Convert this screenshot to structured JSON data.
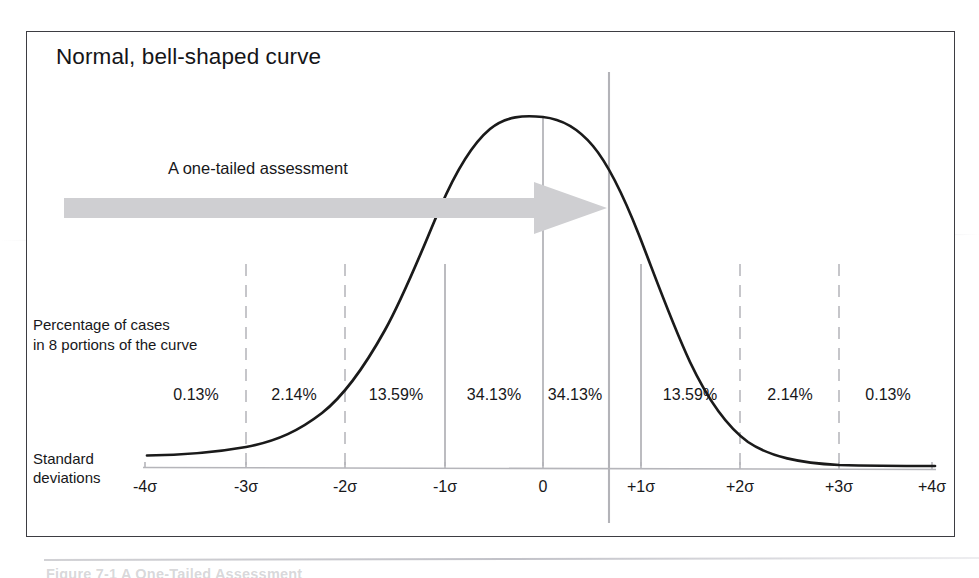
{
  "figure": {
    "title": "Normal, bell-shaped curve",
    "arrow_label": "A one-tailed assessment",
    "percentage_caption_line1": "Percentage of cases",
    "percentage_caption_line2": "in 8 portions of the curve",
    "sd_caption_line1": "Standard",
    "sd_caption_line2": "deviations",
    "caption_ghost": "Figure 7-1   A One-Tailed Assessment"
  },
  "colors": {
    "frame_border": "#3d3d42",
    "curve": "#1a1a1a",
    "gridline_solid": "#b9b9bd",
    "gridline_dashed": "#c6c6ca",
    "cutoff_line": "#b3b3b8",
    "axis_line": "#b5b5ba",
    "arrow_fill": "#cfcfd2",
    "text": "#17171a"
  },
  "chart_data": {
    "type": "line",
    "title": "Normal, bell-shaped curve",
    "xlabel": "Standard deviations",
    "ylabel": "",
    "xlim": [
      -4,
      4
    ],
    "ylim": [
      0,
      1
    ],
    "grid": true,
    "legend": null,
    "distribution": "standard normal (gaussian)",
    "categories": [
      "-4σ",
      "-3σ",
      "-2σ",
      "-1σ",
      "0",
      "+1σ",
      "+2σ",
      "+3σ",
      "+4σ"
    ],
    "tick_values": [
      -4,
      -3,
      -2,
      -1,
      0,
      1,
      2,
      3,
      4
    ],
    "axis_labels": [
      {
        "text": "-4σ",
        "x": 145
      },
      {
        "text": "-3σ",
        "x": 246
      },
      {
        "text": "-2σ",
        "x": 345
      },
      {
        "text": "-1σ",
        "x": 445
      },
      {
        "text": "0",
        "x": 543
      },
      {
        "text": "+1σ",
        "x": 641
      },
      {
        "text": "+2σ",
        "x": 740
      },
      {
        "text": "+3σ",
        "x": 839
      },
      {
        "text": "+4σ",
        "x": 932
      }
    ],
    "portions": [
      {
        "label": "0.13%",
        "value": 0.13,
        "range": "-4σ to -3σ",
        "x": 196
      },
      {
        "label": "2.14%",
        "value": 2.14,
        "range": "-3σ to -2σ",
        "x": 294
      },
      {
        "label": "13.59%",
        "value": 13.59,
        "range": "-2σ to -1σ",
        "x": 396
      },
      {
        "label": "34.13%",
        "value": 34.13,
        "range": "-1σ to 0",
        "x": 494
      },
      {
        "label": "34.13%",
        "value": 34.13,
        "range": "0 to +1σ",
        "x": 575
      },
      {
        "label": "13.59%",
        "value": 13.59,
        "range": "+1σ to +2σ",
        "x": 690
      },
      {
        "label": "2.14%",
        "value": 2.14,
        "range": "+2σ to +3σ",
        "x": 790
      },
      {
        "label": "0.13%",
        "value": 0.13,
        "range": "+3σ to +4σ",
        "x": 888
      }
    ],
    "gridlines": [
      {
        "sigma": -3,
        "x": 246,
        "style": "dashed"
      },
      {
        "sigma": -2,
        "x": 345,
        "style": "dashed"
      },
      {
        "sigma": -1,
        "x": 445,
        "style": "solid"
      },
      {
        "sigma": 0,
        "x": 543,
        "style": "solid"
      },
      {
        "sigma": 1,
        "x": 641,
        "style": "solid"
      },
      {
        "sigma": 2,
        "x": 740,
        "style": "dashed"
      },
      {
        "sigma": 3,
        "x": 839,
        "style": "dashed"
      }
    ],
    "one_tailed_cutoff": {
      "x": 609,
      "sigma": 0.67,
      "label": "A one-tailed assessment"
    },
    "annotations": [
      "Percentage of cases in 8 portions of the curve",
      "Standard deviations",
      "A one-tailed assessment"
    ]
  }
}
